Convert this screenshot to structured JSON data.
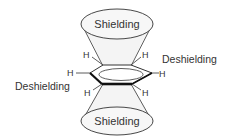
{
  "diagram": {
    "labels": {
      "shielding_top": "Shielding",
      "shielding_bottom": "Shielding",
      "deshielding_right": "Deshielding",
      "deshielding_left": "Deshielding"
    },
    "atoms": {
      "h_top_left": "H",
      "h_top_right": "H",
      "h_left": "H",
      "h_right": "H",
      "h_bottom_left": "H",
      "h_bottom_right": "H"
    },
    "colors": {
      "stroke": "#333333",
      "cone_fill": "#f4f4f4",
      "ellipse_fill": "#f7f7f7",
      "text": "#333333"
    }
  }
}
